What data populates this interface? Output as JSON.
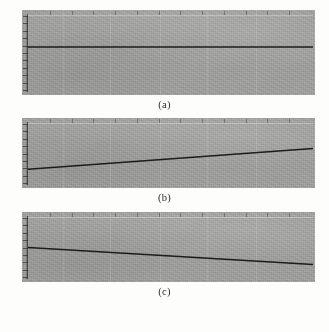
{
  "figure": {
    "background_color": "#fdfdfc",
    "panel_fill_color": "#9d9d9b",
    "line_color": "#1c1c1c",
    "axis_color": "#2d2d2d",
    "panels": [
      {
        "id": "panel-a",
        "caption": "(a)",
        "x": 22,
        "y": 10,
        "width": 293,
        "height": 85,
        "y_tick_count": 11,
        "top_tick_count": 13
      },
      {
        "id": "panel-b",
        "caption": "(b)",
        "x": 22,
        "y": 118,
        "width": 293,
        "height": 70,
        "y_tick_count": 9,
        "top_tick_count": 13
      },
      {
        "id": "panel-c",
        "caption": "(c)",
        "x": 22,
        "y": 212,
        "width": 293,
        "height": 70,
        "y_tick_count": 9,
        "top_tick_count": 13
      }
    ],
    "captions": {
      "a": "(a)",
      "b": "(b)",
      "c": "(c)"
    },
    "bottom_text": ""
  },
  "chart_data": [
    {
      "type": "line",
      "panel": "(a)",
      "title": "",
      "xlabel": "",
      "ylabel": "",
      "xlim": [
        0,
        1
      ],
      "ylim": [
        0,
        1
      ],
      "grid": false,
      "legend": "none",
      "tick_labels_x": [],
      "tick_labels_y": [],
      "annotation": "flat horizontal line (zero slope)",
      "series": [
        {
          "name": "trend",
          "x": [
            0,
            1
          ],
          "values": [
            0.58,
            0.58
          ]
        }
      ]
    },
    {
      "type": "line",
      "panel": "(b)",
      "title": "",
      "xlabel": "",
      "ylabel": "",
      "xlim": [
        0,
        1
      ],
      "ylim": [
        0,
        1
      ],
      "grid": false,
      "legend": "none",
      "tick_labels_x": [],
      "tick_labels_y": [],
      "annotation": "line with positive slope (increasing)",
      "series": [
        {
          "name": "trend",
          "x": [
            0,
            1
          ],
          "values": [
            0.24,
            0.58
          ]
        }
      ]
    },
    {
      "type": "line",
      "panel": "(c)",
      "title": "",
      "xlabel": "",
      "ylabel": "",
      "xlim": [
        0,
        1
      ],
      "ylim": [
        0,
        1
      ],
      "grid": false,
      "legend": "none",
      "tick_labels_x": [],
      "tick_labels_y": [],
      "annotation": "line with negative slope (decreasing)",
      "series": [
        {
          "name": "trend",
          "x": [
            0,
            1
          ],
          "values": [
            0.5,
            0.22
          ]
        }
      ]
    }
  ]
}
